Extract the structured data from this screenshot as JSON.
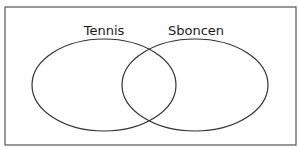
{
  "diagram": {
    "type": "venn",
    "sets": [
      {
        "label": "Tennis",
        "cx": 104,
        "cy": 85,
        "rx": 72,
        "ry": 46,
        "label_x": 104,
        "label_y": 23
      },
      {
        "label": "Sboncen",
        "cx": 195,
        "cy": 85,
        "rx": 73,
        "ry": 46,
        "label_x": 196,
        "label_y": 23
      }
    ],
    "stroke_color": "#333333",
    "frame_color": "#555555"
  }
}
